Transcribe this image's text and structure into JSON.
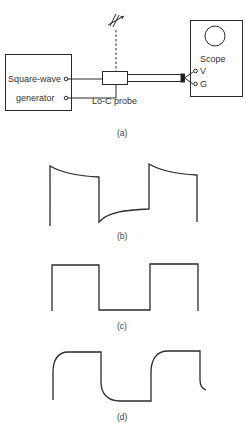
{
  "figure": {
    "panel_a": {
      "caption": "(a)",
      "generator_label_line1": "Square-wave",
      "generator_label_line2": "generator",
      "probe_label": "Lo-C probe",
      "scope_label": "Scope",
      "scope_terminal_v": "V",
      "scope_terminal_g": "G",
      "trimmer": "variable-capacitor-icon"
    },
    "panel_b": {
      "caption": "(b)",
      "waveform": "square wave with overshoot and exponential decay (overcompensated)"
    },
    "panel_c": {
      "caption": "(c)",
      "waveform": "ideal square wave (correctly compensated)"
    },
    "panel_d": {
      "caption": "(d)",
      "waveform": "square wave with rounded leading edges (undercompensated)"
    }
  },
  "colors": {
    "line": "#2a2a2a",
    "background": "#ffffff"
  }
}
